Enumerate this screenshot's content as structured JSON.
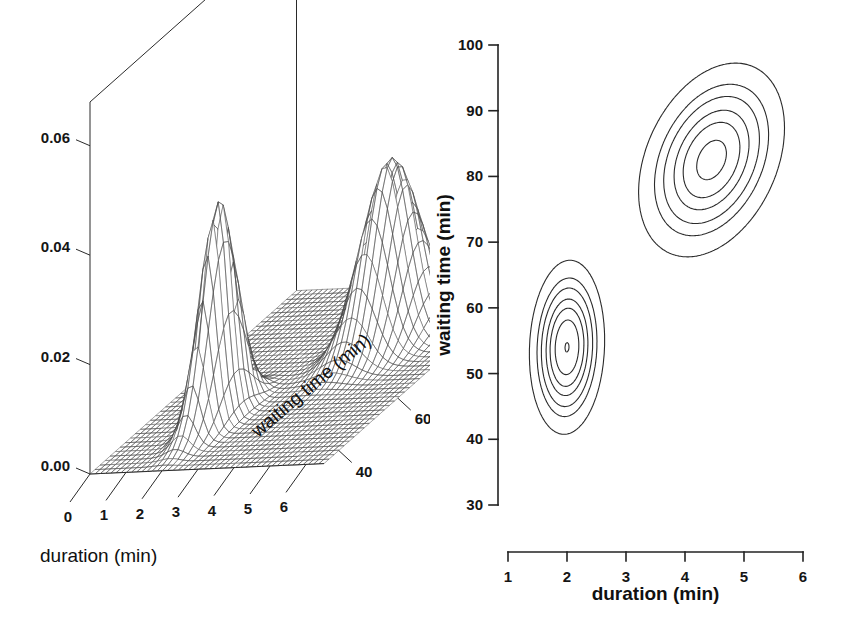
{
  "figure": {
    "background": "#ffffff",
    "ink_color": "#222222"
  },
  "panels": {
    "left": {
      "name": "perspective-surface-plot",
      "type": "surface3d",
      "z_ticks": [
        "0.00",
        "0.02",
        "0.04",
        "0.06"
      ],
      "z_values": [
        0.0,
        0.02,
        0.04,
        0.06
      ],
      "x_ticks": [
        "0",
        "1",
        "2",
        "3",
        "4",
        "5",
        "6"
      ],
      "x_values": [
        0,
        1,
        2,
        3,
        4,
        5,
        6
      ],
      "y_ticks": [
        "40",
        "60",
        "80",
        "100"
      ],
      "y_values": [
        40,
        60,
        80,
        100
      ],
      "x_title": "duration (min)",
      "y_title": "waiting time (min)",
      "z_title": ""
    },
    "right": {
      "name": "contour-plot",
      "type": "contour",
      "x_ticks": [
        "1",
        "2",
        "3",
        "4",
        "5",
        "6"
      ],
      "x_values": [
        1,
        2,
        3,
        4,
        5,
        6
      ],
      "y_ticks": [
        "30",
        "40",
        "50",
        "60",
        "70",
        "80",
        "90",
        "100"
      ],
      "y_values": [
        30,
        40,
        50,
        60,
        70,
        80,
        90,
        100
      ],
      "x_title": "duration  (min)",
      "y_title": "waiting time (min)",
      "xlim": [
        1,
        6
      ],
      "ylim": [
        30,
        100
      ]
    }
  },
  "chart_data": {
    "type": "contour",
    "title": "",
    "xlabel": "duration (min)",
    "ylabel": "waiting time (min)",
    "zlabel": "density",
    "xlim": [
      1,
      6
    ],
    "ylim": [
      30,
      100
    ],
    "zlim": [
      0.0,
      0.068
    ],
    "grid": false,
    "legend": "none",
    "model": {
      "kind": "gaussian-mixture",
      "components": [
        {
          "name": "short-eruption-mode",
          "weight": 0.355,
          "mean_duration_min": 2.0,
          "mean_waiting_min": 54.0,
          "sd_duration_min": 0.26,
          "sd_waiting_min": 5.4,
          "correlation": 0.08,
          "peak_density": 0.0655
        },
        {
          "name": "long-eruption-mode",
          "weight": 0.645,
          "mean_duration_min": 4.45,
          "mean_waiting_min": 82.5,
          "sd_duration_min": 0.52,
          "sd_waiting_min": 6.2,
          "correlation": 0.33,
          "peak_density": 0.0525
        }
      ]
    },
    "contour_levels": [
      0.002,
      0.006,
      0.01,
      0.016,
      0.022,
      0.03,
      0.04,
      0.05,
      0.058
    ],
    "peaks": [
      {
        "x": 2.0,
        "y": 54,
        "z": 0.0655
      },
      {
        "x": 4.45,
        "y": 82.5,
        "z": 0.0525
      }
    ],
    "surface_grid": {
      "nx": 40,
      "ny": 40,
      "x_range": [
        0,
        6.5
      ],
      "y_range": [
        35,
        105
      ]
    }
  }
}
